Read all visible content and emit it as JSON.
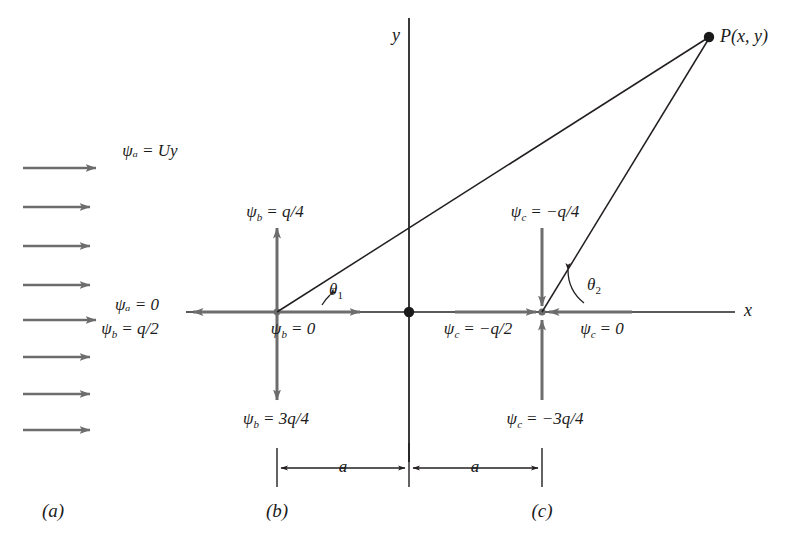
{
  "figure": {
    "type": "fluid-flow-superposition-diagram",
    "panels": [
      {
        "key": "a",
        "label": "(a)",
        "description": "uniform stream"
      },
      {
        "key": "b",
        "label": "(b)",
        "description": "line source"
      },
      {
        "key": "c",
        "label": "(c)",
        "description": "line sink"
      }
    ]
  },
  "axes": {
    "x_label": "x",
    "y_label": "y",
    "origin_marker": "dot"
  },
  "panel_a": {
    "arrow_count": 8,
    "labels": {
      "top": "ψₐ = Uy",
      "mid": "ψₐ = 0"
    },
    "label_top_text": "ψ",
    "label_top_sub": "a",
    "label_top_rhs": "= Uy",
    "label_mid_rhs": "= 0"
  },
  "panel_b": {
    "center_label": "source",
    "labels": {
      "up": {
        "sym": "ψ",
        "sub": "b",
        "rhs": "= q/4"
      },
      "left": {
        "sym": "ψ",
        "sub": "b",
        "rhs": "= q/2"
      },
      "right": {
        "sym": "ψ",
        "sub": "b",
        "rhs": "= 0"
      },
      "down": {
        "sym": "ψ",
        "sub": "b",
        "rhs": "= 3q/4"
      }
    },
    "angle_label": "θ",
    "angle_sub": "1"
  },
  "panel_c": {
    "center_label": "sink",
    "labels": {
      "up": {
        "sym": "ψ",
        "sub": "c",
        "rhs": "= −q/4"
      },
      "left": {
        "sym": "ψ",
        "sub": "c",
        "rhs": "= −q/2"
      },
      "right": {
        "sym": "ψ",
        "sub": "c",
        "rhs": "= 0"
      },
      "down": {
        "sym": "ψ",
        "sub": "c",
        "rhs": "= −3q/4"
      }
    },
    "angle_label": "θ",
    "angle_sub": "2"
  },
  "point_p": {
    "sym": "P",
    "coords": "(x, y)"
  },
  "dimensions": {
    "left_span": "a",
    "right_span": "a"
  },
  "colors": {
    "arrow_gray": "#6d6d6d",
    "line_black": "#231f20",
    "background": "#ffffff"
  }
}
